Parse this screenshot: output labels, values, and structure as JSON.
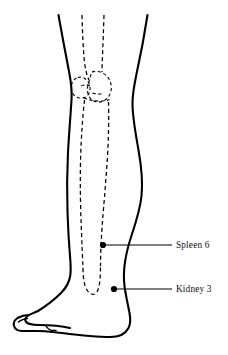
{
  "figure": {
    "view": "medial-lower-leg-and-foot",
    "background_color": "#ffffff",
    "line_color": "#000000"
  },
  "annotations": [
    {
      "id": "spleen-6",
      "label": "Spleen 6",
      "dot": {
        "x": 103,
        "y": 245
      },
      "leader": {
        "x1": 106,
        "y1": 245,
        "x2": 172,
        "y2": 245
      },
      "text_anchor": {
        "x": 176,
        "y": 248
      }
    },
    {
      "id": "kidney-3",
      "label": "Kidney 3",
      "dot": {
        "x": 114,
        "y": 289
      },
      "leader": {
        "x1": 117,
        "y1": 289,
        "x2": 172,
        "y2": 289
      },
      "text_anchor": {
        "x": 176,
        "y": 292
      }
    }
  ],
  "anatomy": {
    "leg_outline_name": "leg-and-foot-outline",
    "bone_outline_name": "tibia-and-knee-bones-dashed"
  }
}
